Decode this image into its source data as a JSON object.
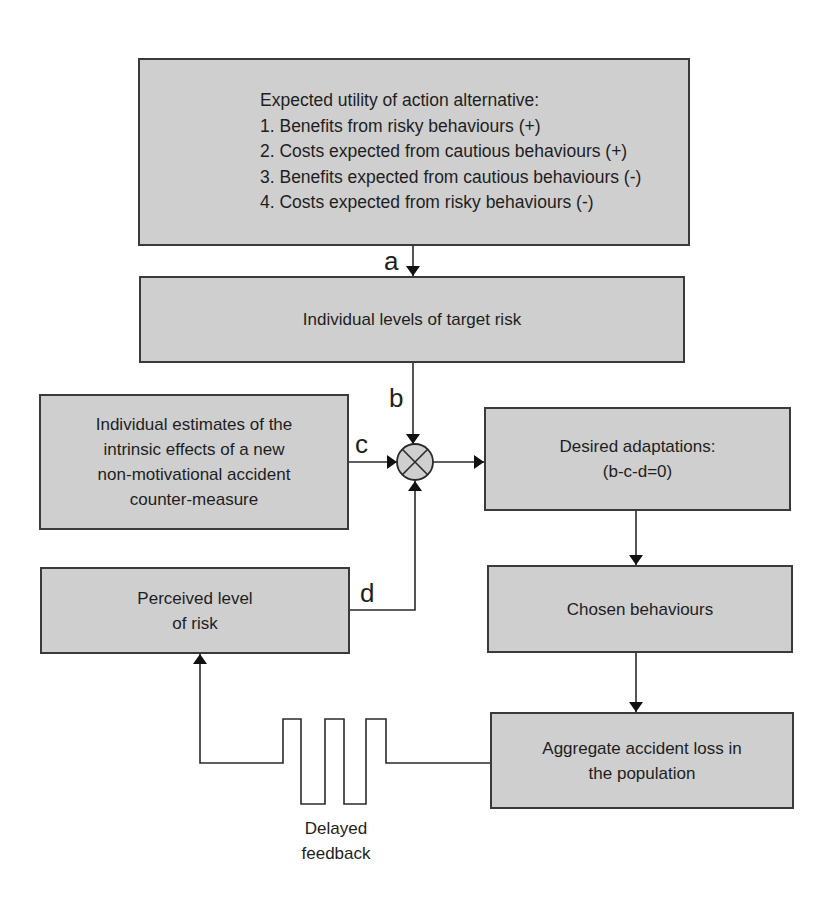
{
  "diagram": {
    "type": "flowchart",
    "nodes": {
      "utility": {
        "heading": "Expected utility of action alternative:",
        "items": [
          "1. Benefits from risky behaviours (+)",
          "2. Costs expected from cautious behaviours (+)",
          "3. Benefits expected from cautious behaviours (-)",
          "4. Costs expected from risky behaviours (-)"
        ]
      },
      "target_risk": {
        "label": "Individual levels of target risk"
      },
      "countermeasure": {
        "lines": [
          "Individual estimates of the",
          "intrinsic effects of a new",
          "non-motivational accident",
          "counter-measure"
        ]
      },
      "desired": {
        "lines": [
          "Desired adaptations:",
          "(b-c-d=0)"
        ]
      },
      "perceived": {
        "lines": [
          "Perceived level",
          "of risk"
        ]
      },
      "chosen": {
        "label": "Chosen behaviours"
      },
      "aggregate": {
        "lines": [
          "Aggregate accident loss in",
          "the population"
        ]
      },
      "comparator": {
        "symbol": "⊗"
      }
    },
    "edge_labels": {
      "a": "a",
      "b": "b",
      "c": "c",
      "d": "d"
    },
    "delay": {
      "lines": [
        "Delayed",
        "feedback"
      ]
    },
    "edges": [
      {
        "from": "utility",
        "to": "target_risk",
        "label": "a"
      },
      {
        "from": "target_risk",
        "to": "comparator",
        "label": "b"
      },
      {
        "from": "countermeasure",
        "to": "comparator",
        "label": "c"
      },
      {
        "from": "perceived",
        "to": "comparator",
        "label": "d"
      },
      {
        "from": "comparator",
        "to": "desired"
      },
      {
        "from": "desired",
        "to": "chosen"
      },
      {
        "from": "chosen",
        "to": "aggregate"
      },
      {
        "from": "aggregate",
        "to": "perceived",
        "label": "Delayed feedback"
      }
    ],
    "colors": {
      "box_fill": "#cfcfcf",
      "line": "#2a2a2a"
    }
  }
}
